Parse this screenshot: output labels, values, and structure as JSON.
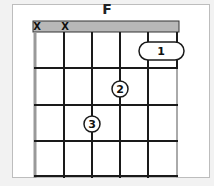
{
  "diagram": {
    "chord_name": "F",
    "strings": 6,
    "frets": 4,
    "muted_strings": [
      1,
      2
    ],
    "muted_label": "X",
    "fingers": [
      {
        "finger": "1",
        "string": 5,
        "to_string": 6,
        "fret": 1,
        "barre": true
      },
      {
        "finger": "2",
        "string": 4,
        "fret": 2,
        "barre": false
      },
      {
        "finger": "3",
        "string": 3,
        "fret": 3,
        "barre": false
      }
    ],
    "colors": {
      "nut": "#b8b8b8",
      "lines": "#1a1a1a",
      "frame_border": "#bdbdbd"
    }
  }
}
